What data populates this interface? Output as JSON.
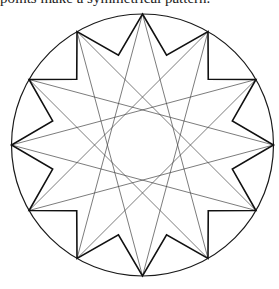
{
  "caption": "points make a symmetrical pattern.",
  "figure": {
    "type": "star-pattern",
    "center": [
      142.5,
      145
    ],
    "circle_radius": 131,
    "points": 12,
    "outer_radius": 131,
    "inner_radius": 93,
    "star_polygon_step": 5,
    "colors": {
      "circle": "#1a1a1a",
      "outline": "#111111",
      "chords": "#444444"
    }
  }
}
